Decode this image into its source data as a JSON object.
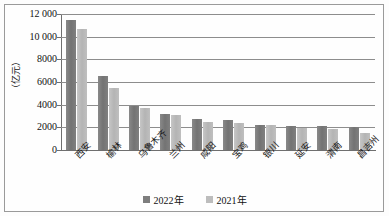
{
  "chart_data": {
    "type": "bar",
    "title": "",
    "xlabel": "",
    "ylabel": "（亿元）",
    "ylim": [
      0,
      12000
    ],
    "ytick_labels": [
      "0",
      "2000",
      "4000",
      "6000",
      "8000",
      "10 000",
      "12 000"
    ],
    "ytick_values": [
      0,
      2000,
      4000,
      6000,
      8000,
      10000,
      12000
    ],
    "grid": true,
    "legend_position": "bottom-center",
    "categories": [
      "西安",
      "榆林",
      "乌鲁木齐",
      "兰州",
      "咸阳",
      "宝鸡",
      "银川",
      "延安",
      "渭南",
      "昌吉州"
    ],
    "series": [
      {
        "name": "2022年",
        "color": "#7e7e7e",
        "values": [
          11487,
          6544,
          3893,
          3154,
          2725,
          2654,
          2170,
          2103,
          2095,
          1990
        ]
      },
      {
        "name": "2021年",
        "color": "#bdbdbd",
        "values": [
          10688,
          5435,
          3680,
          3104,
          2493,
          2422,
          2177,
          1927,
          1895,
          1545
        ]
      }
    ]
  },
  "legend": {
    "items": [
      {
        "label": "2022年",
        "color": "#7e7e7e"
      },
      {
        "label": "2021年",
        "color": "#bdbdbd"
      }
    ]
  },
  "axis": {
    "y_title": "（亿元）"
  }
}
